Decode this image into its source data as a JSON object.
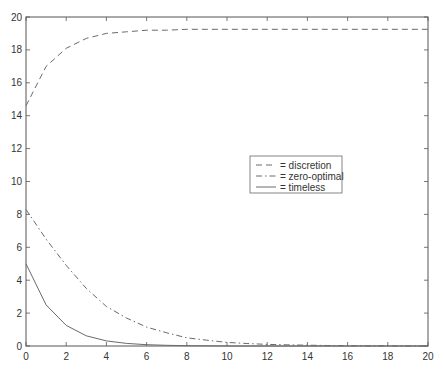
{
  "chart_data": {
    "type": "line",
    "title": "",
    "xlabel": "",
    "ylabel": "",
    "xlim": [
      0,
      20
    ],
    "ylim": [
      0,
      20
    ],
    "grid": false,
    "legend_position": "inside-right-center",
    "x_ticks": [
      "0",
      "2",
      "4",
      "6",
      "8",
      "10",
      "12",
      "14",
      "16",
      "18",
      "20"
    ],
    "y_ticks": [
      "0",
      "2",
      "4",
      "6",
      "8",
      "10",
      "12",
      "14",
      "16",
      "18",
      "20"
    ],
    "x": [
      0,
      1,
      2,
      3,
      4,
      5,
      6,
      7,
      8,
      9,
      10,
      11,
      12,
      13,
      14,
      15,
      16,
      17,
      18,
      19,
      20
    ],
    "series": [
      {
        "name": "discretion",
        "legend_label": "= discretion",
        "style": "dashed",
        "values": [
          14.6,
          17.0,
          18.1,
          18.7,
          19.0,
          19.1,
          19.2,
          19.2,
          19.25,
          19.25,
          19.25,
          19.25,
          19.25,
          19.25,
          19.25,
          19.25,
          19.25,
          19.25,
          19.25,
          19.25,
          19.25
        ]
      },
      {
        "name": "zero-optimal",
        "legend_label": "= zero-optimal",
        "style": "dashdot",
        "values": [
          8.3,
          6.5,
          4.9,
          3.5,
          2.4,
          1.7,
          1.15,
          0.8,
          0.5,
          0.35,
          0.22,
          0.15,
          0.1,
          0.07,
          0.05,
          0.03,
          0.02,
          0.01,
          0.01,
          0.0,
          0.0
        ]
      },
      {
        "name": "timeless",
        "legend_label": "= timeless",
        "style": "solid",
        "values": [
          5.0,
          2.5,
          1.25,
          0.62,
          0.31,
          0.16,
          0.08,
          0.04,
          0.02,
          0.01,
          0.0,
          0.0,
          0.0,
          0.0,
          0.0,
          0.0,
          0.0,
          0.0,
          0.0,
          0.0,
          0.0
        ]
      }
    ]
  },
  "colors": {
    "axis": "#555555",
    "line": "#6a6a6a",
    "background": "#ffffff"
  }
}
